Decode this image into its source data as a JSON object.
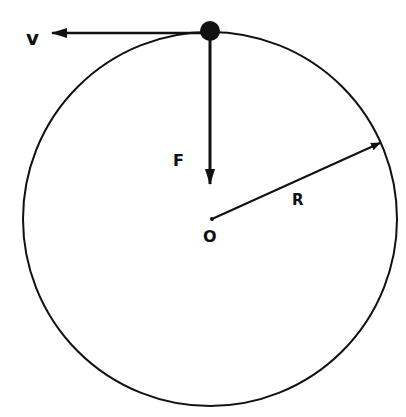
{
  "diagram": {
    "type": "uniform-circular-motion",
    "colors": {
      "ink": "#111111",
      "background": "#ffffff"
    },
    "circle": {
      "cx": 210,
      "cy": 219,
      "r": 187
    },
    "body": {
      "cx": 210,
      "cy": 31,
      "r": 10
    },
    "labels": {
      "velocity": "v",
      "force": "F",
      "radius": "R",
      "center": "O"
    }
  }
}
